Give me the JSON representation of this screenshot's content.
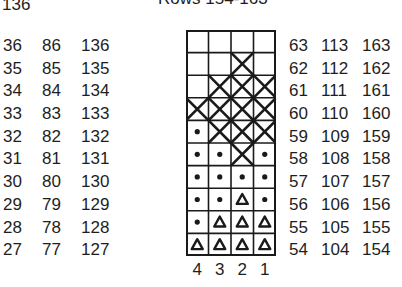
{
  "header": {
    "top_left_number": "136",
    "title": "Rows 154-163"
  },
  "left_rows": {
    "col_a": [
      "36",
      "35",
      "34",
      "33",
      "32",
      "31",
      "30",
      "29",
      "28",
      "27"
    ],
    "col_b": [
      "86",
      "85",
      "84",
      "83",
      "82",
      "81",
      "80",
      "79",
      "78",
      "77"
    ],
    "col_c": [
      "136",
      "135",
      "134",
      "133",
      "132",
      "131",
      "130",
      "129",
      "128",
      "127"
    ]
  },
  "right_rows": {
    "col_a": [
      "63",
      "62",
      "61",
      "60",
      "59",
      "58",
      "57",
      "56",
      "55",
      "54"
    ],
    "col_b": [
      "113",
      "112",
      "111",
      "110",
      "109",
      "108",
      "107",
      "106",
      "105",
      "104"
    ],
    "col_c": [
      "163",
      "162",
      "161",
      "160",
      "159",
      "158",
      "157",
      "156",
      "155",
      "154"
    ]
  },
  "chart_grid": {
    "columns": [
      "4",
      "3",
      "2",
      "1"
    ],
    "rows_top_to_bottom": [
      [
        "empty",
        "empty",
        "empty",
        "empty"
      ],
      [
        "empty",
        "empty",
        "x",
        "empty"
      ],
      [
        "empty",
        "x",
        "x",
        "x"
      ],
      [
        "x",
        "x",
        "x",
        "x"
      ],
      [
        "dot",
        "x",
        "x",
        "x"
      ],
      [
        "dot",
        "dot",
        "x",
        "dot"
      ],
      [
        "dot",
        "dot",
        "dot",
        "dot"
      ],
      [
        "dot",
        "dot",
        "triangle",
        "dot"
      ],
      [
        "dot",
        "triangle",
        "triangle",
        "triangle"
      ],
      [
        "triangle",
        "triangle",
        "triangle",
        "triangle"
      ]
    ],
    "colors": {
      "ink": "#1a1a1a",
      "background": "#ffffff"
    }
  }
}
